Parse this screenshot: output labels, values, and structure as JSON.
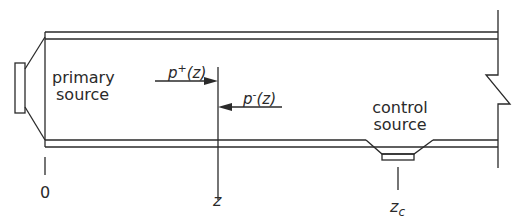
{
  "diagram": {
    "type": "duct active noise control schematic",
    "labels": {
      "primary_source_line1": "primary",
      "primary_source_line2": "source",
      "control_source_line1": "control",
      "control_source_line2": "source",
      "p_plus": "p",
      "p_plus_sup": "+",
      "p_plus_arg": "(z)",
      "p_minus": "p",
      "p_minus_sup": "-",
      "p_minus_arg": "(z)",
      "origin": "0",
      "z": "z",
      "zc": "z",
      "zc_sub": "c"
    },
    "colors": {
      "stroke": "#2a2a2a",
      "background": "#ffffff"
    }
  }
}
